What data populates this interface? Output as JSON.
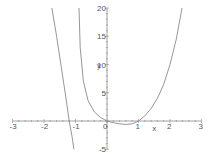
{
  "chart_data": {
    "type": "line",
    "title": "",
    "xlabel": "x",
    "ylabel": "y",
    "xlim": [
      -3,
      3
    ],
    "ylim": [
      -5,
      20
    ],
    "grid": false,
    "x_ticks": [
      -3,
      -2,
      -1,
      0,
      1,
      2,
      3
    ],
    "x_tick_labels": [
      "-3",
      "-2",
      "-1",
      "0",
      "1",
      "2",
      "3"
    ],
    "y_ticks": [
      -5,
      5,
      10,
      15,
      20
    ],
    "y_tick_labels": [
      "-5",
      "5",
      "10",
      "15",
      "20"
    ],
    "series": [
      {
        "name": "curve-left",
        "x": [
          -1.75,
          -1.6,
          -1.45,
          -1.3,
          -1.2,
          -1.1,
          -1.05
        ],
        "y": [
          20,
          15,
          9.5,
          4,
          0,
          -3,
          -5
        ]
      },
      {
        "name": "curve-right",
        "x": [
          -0.89,
          -0.85,
          -0.75,
          -0.6,
          -0.4,
          -0.2,
          0,
          0.2,
          0.4,
          0.6,
          0.8,
          1.0,
          1.2,
          1.4,
          1.6,
          1.8,
          2.0,
          2.2,
          2.38
        ],
        "y": [
          20,
          13,
          7,
          3.6,
          1.6,
          0.6,
          0,
          -0.3,
          -0.5,
          -0.6,
          -0.5,
          0,
          0.9,
          2.2,
          4,
          6.5,
          10,
          14.5,
          20
        ]
      }
    ]
  },
  "axes": {
    "x_label": "x",
    "y_label": "y",
    "x_ticks": [
      {
        "v": -3,
        "label": "-3"
      },
      {
        "v": -2,
        "label": "-2"
      },
      {
        "v": -1,
        "label": "-1"
      },
      {
        "v": 0,
        "label": "0"
      },
      {
        "v": 1,
        "label": "1"
      },
      {
        "v": 2,
        "label": "2"
      },
      {
        "v": 3,
        "label": "3"
      }
    ],
    "y_ticks": [
      {
        "v": -5,
        "label": "-5"
      },
      {
        "v": 5,
        "label": "5"
      },
      {
        "v": 10,
        "label": "10"
      },
      {
        "v": 15,
        "label": "15"
      },
      {
        "v": 20,
        "label": "20"
      }
    ]
  },
  "colors": {
    "curve": "#8a8a8a",
    "axis": "#8a8a8a",
    "text": "#555555"
  }
}
